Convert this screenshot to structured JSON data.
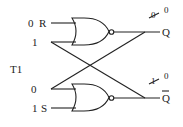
{
  "diagram": {
    "type": "SR latch (cross-coupled NOR gates)",
    "inputs": {
      "r_value": "0",
      "r_label": "R",
      "r_feedback_value": "1",
      "timing_label": "T1",
      "s_feedback_value": "0",
      "s_value": "1",
      "s_label": "S"
    },
    "outputs": {
      "q_label": "Q",
      "q_old_value": "0",
      "q_new_value": "0",
      "qbar_label": "Q",
      "qbar_old_value": "1",
      "qbar_new_value": "0"
    },
    "gates": [
      {
        "name": "top-nor-gate",
        "type": "NOR"
      },
      {
        "name": "bottom-nor-gate",
        "type": "NOR"
      }
    ],
    "colors": {
      "stroke": "#222222",
      "background": "#ffffff"
    }
  }
}
